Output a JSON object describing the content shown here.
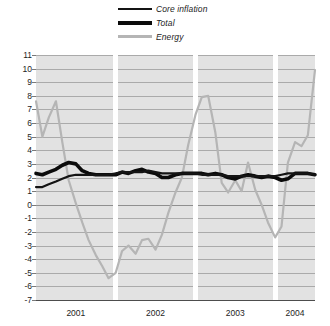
{
  "legend": {
    "position": "top-center",
    "items": [
      {
        "label": "Core inflation",
        "color": "#141414",
        "style": "thin-solid"
      },
      {
        "label": "Total",
        "color": "#0b0b0b",
        "style": "thick-solid"
      },
      {
        "label": "Energy",
        "color": "#b5b5b5",
        "style": "medium-solid"
      }
    ]
  },
  "axes": {
    "y_ticks": [
      "11",
      "10",
      "9",
      "8",
      "7",
      "6",
      "5",
      "4",
      "3",
      "2",
      "1",
      "0",
      "-1",
      "-2",
      "-3",
      "-4",
      "-5",
      "-6",
      "-7"
    ],
    "x_ticks": [
      "2001",
      "2002",
      "2003",
      "2004"
    ]
  },
  "chart_data": {
    "type": "line",
    "title": "",
    "subtitle": "",
    "xlabel": "",
    "ylabel": "",
    "ylim": [
      -7,
      11
    ],
    "xlim": [
      2000.92,
      2004.42
    ],
    "grid": true,
    "gridlines_y": [
      11,
      10,
      9,
      8,
      7,
      6,
      5,
      4,
      3,
      2,
      1,
      0,
      -1,
      -2,
      -3,
      -4,
      -5,
      -6,
      -7
    ],
    "legend_position": "top-center",
    "x_tick_labels": [
      "2001",
      "2002",
      "2003",
      "2004"
    ],
    "x_tick_values": [
      2001.42,
      2002.42,
      2003.42,
      2004.17
    ],
    "year_separators": [
      2001.92,
      2002.92,
      2003.92
    ],
    "x": [
      2000.92,
      2001.0,
      2001.08,
      2001.17,
      2001.25,
      2001.33,
      2001.42,
      2001.5,
      2001.58,
      2001.67,
      2001.75,
      2001.83,
      2001.92,
      2002.0,
      2002.08,
      2002.17,
      2002.25,
      2002.33,
      2002.42,
      2002.5,
      2002.58,
      2002.67,
      2002.75,
      2002.83,
      2002.92,
      2003.0,
      2003.08,
      2003.17,
      2003.25,
      2003.33,
      2003.42,
      2003.5,
      2003.58,
      2003.67,
      2003.75,
      2003.83,
      2003.92,
      2004.0,
      2004.08,
      2004.17,
      2004.25,
      2004.33,
      2004.42
    ],
    "series": [
      {
        "name": "Energy",
        "color": "#b5b5b5",
        "width": 2.2,
        "values": [
          7.6,
          5.0,
          6.4,
          7.6,
          4.6,
          1.8,
          0.1,
          -1.3,
          -2.6,
          -3.7,
          -4.5,
          -5.4,
          -5.0,
          -3.4,
          -3.0,
          -3.6,
          -2.6,
          -2.5,
          -3.3,
          -2.2,
          -0.6,
          0.9,
          2.0,
          4.4,
          6.6,
          7.9,
          8.0,
          5.3,
          1.6,
          0.9,
          1.8,
          1.0,
          3.1,
          1.1,
          0.0,
          -1.3,
          -2.4,
          -1.6,
          3.1,
          4.6,
          4.3,
          5.1,
          9.9
        ]
      },
      {
        "name": "Total",
        "color": "#0b0b0b",
        "width": 3.6,
        "values": [
          2.3,
          2.2,
          2.4,
          2.6,
          2.9,
          3.1,
          3.0,
          2.5,
          2.3,
          2.2,
          2.2,
          2.2,
          2.2,
          2.4,
          2.3,
          2.5,
          2.6,
          2.4,
          2.3,
          2.0,
          2.0,
          2.2,
          2.3,
          2.3,
          2.3,
          2.3,
          2.2,
          2.3,
          2.2,
          2.0,
          1.9,
          2.1,
          2.2,
          2.1,
          2.0,
          2.1,
          2.0,
          1.8,
          1.9,
          2.3,
          2.3,
          2.3,
          2.2
        ]
      },
      {
        "name": "Core inflation",
        "color": "#141414",
        "width": 2.2,
        "values": [
          1.3,
          1.3,
          1.5,
          1.7,
          1.9,
          2.1,
          2.2,
          2.2,
          2.2,
          2.2,
          2.2,
          2.2,
          2.3,
          2.4,
          2.4,
          2.4,
          2.4,
          2.5,
          2.4,
          2.3,
          2.3,
          2.3,
          2.3,
          2.3,
          2.3,
          2.2,
          2.2,
          2.2,
          2.2,
          2.1,
          2.1,
          2.1,
          2.1,
          2.1,
          2.1,
          2.1,
          2.1,
          2.2,
          2.3,
          2.3,
          2.3,
          2.3,
          2.2
        ]
      }
    ]
  }
}
